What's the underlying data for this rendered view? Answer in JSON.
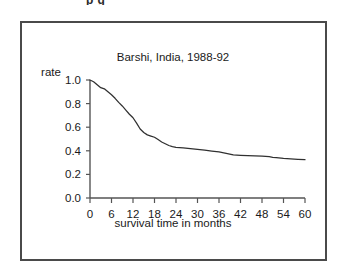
{
  "figure": {
    "cropped_caption_fragment": "p g",
    "border_color": "#4a4a4a",
    "background_color": "#ffffff"
  },
  "chart_data": {
    "type": "line",
    "title": "Barshi, India, 1988-92",
    "xlabel": "survival time in months",
    "ylabel": "rate",
    "xlim": [
      0,
      60
    ],
    "ylim": [
      0.0,
      1.0
    ],
    "grid": false,
    "legend": null,
    "line_color": "#303030",
    "xticks": [
      0,
      6,
      12,
      18,
      24,
      30,
      36,
      42,
      48,
      54,
      60
    ],
    "xtick_labels": [
      "0",
      "6",
      "12",
      "18",
      "24",
      "30",
      "36",
      "42",
      "48",
      "54",
      "60"
    ],
    "yticks": [
      0.0,
      0.2,
      0.4,
      0.6,
      0.8,
      1.0
    ],
    "ytick_labels": [
      "0.0",
      "0.2",
      "0.4",
      "0.6",
      "0.8",
      "1.0"
    ],
    "series": [
      {
        "name": "survival rate",
        "x": [
          0,
          1,
          2,
          3,
          4,
          5,
          6,
          7,
          8,
          9,
          10,
          11,
          12,
          13,
          14,
          15,
          16,
          17,
          18,
          19,
          20,
          21,
          22,
          23,
          24,
          26,
          28,
          30,
          32,
          34,
          36,
          38,
          40,
          42,
          44,
          46,
          48,
          50,
          51,
          52,
          54,
          56,
          58,
          60
        ],
        "y": [
          1.0,
          0.985,
          0.96,
          0.935,
          0.925,
          0.9,
          0.875,
          0.845,
          0.81,
          0.78,
          0.745,
          0.71,
          0.68,
          0.635,
          0.585,
          0.555,
          0.535,
          0.525,
          0.515,
          0.495,
          0.475,
          0.46,
          0.445,
          0.435,
          0.43,
          0.425,
          0.418,
          0.412,
          0.405,
          0.398,
          0.39,
          0.378,
          0.365,
          0.362,
          0.36,
          0.358,
          0.355,
          0.35,
          0.345,
          0.342,
          0.335,
          0.332,
          0.328,
          0.325
        ]
      }
    ]
  }
}
